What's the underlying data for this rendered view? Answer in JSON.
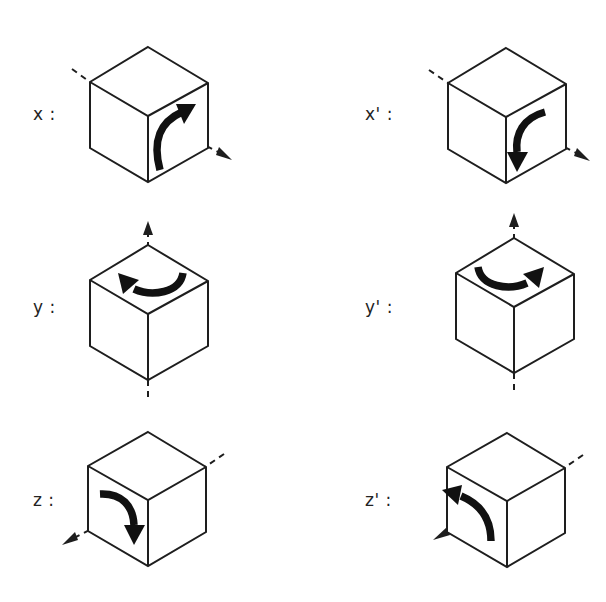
{
  "figure": {
    "background_color": "#ffffff",
    "ink_color": "#1e1e1e",
    "columns": 2,
    "rows": 3,
    "items": [
      {
        "id": "x",
        "label": "x :",
        "axis": "x",
        "axis_name": "x-axis",
        "axis_direction": "down-right diagonal, arrowhead at lower-right",
        "rotation": "counter-clockwise arrow on right face sweeping upward",
        "arrow_direction": "up",
        "prime": false
      },
      {
        "id": "x-prime",
        "label": "x' :",
        "axis": "x",
        "axis_name": "x-axis",
        "axis_direction": "down-right diagonal, arrowhead at lower-right",
        "rotation": "clockwise arrow on right face sweeping downward",
        "arrow_direction": "down",
        "prime": true
      },
      {
        "id": "y",
        "label": "y :",
        "axis": "y",
        "axis_name": "y-axis",
        "axis_direction": "vertical, arrowhead at top",
        "rotation": "arrow on top face sweeping to the left",
        "arrow_direction": "left",
        "prime": false
      },
      {
        "id": "y-prime",
        "label": "y' :",
        "axis": "y",
        "axis_name": "y-axis",
        "axis_direction": "vertical, arrowhead at top",
        "rotation": "arrow on top face sweeping to the right",
        "arrow_direction": "right",
        "prime": true
      },
      {
        "id": "z",
        "label": "z :",
        "axis": "z",
        "axis_name": "z-axis",
        "axis_direction": "down-left diagonal, arrowhead at lower-left",
        "rotation": "arrow on left face sweeping downward",
        "arrow_direction": "down",
        "prime": false
      },
      {
        "id": "z-prime",
        "label": "z' :",
        "axis": "z",
        "axis_name": "z-axis",
        "axis_direction": "down-left diagonal, arrowhead at lower-left",
        "rotation": "arrow on left face sweeping upward",
        "arrow_direction": "up",
        "prime": true
      }
    ]
  }
}
